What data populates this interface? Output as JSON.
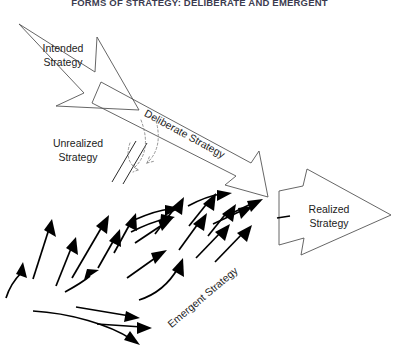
{
  "figure": {
    "title": "FORMS OF STRATEGY: DELIBERATE AND EMERGENT",
    "title_visible": "partially cropped at top edge",
    "background_color": "#ffffff",
    "outline_color": "#555555",
    "arrow_color": "#000000",
    "dashed_color": "#8a8a8a",
    "label_color": "#1c1c1c",
    "title_color": "#3c3c50"
  },
  "labels": {
    "intended": {
      "line1": "Intended",
      "line2": "Strategy"
    },
    "unrealized": {
      "line1": "Unrealized",
      "line2": "Strategy"
    },
    "realized": {
      "line1": "Realized",
      "line2": "Strategy"
    },
    "deliberate": "Deliberate Strategy",
    "emergent": "Emergent Strategy"
  },
  "shapes": {
    "intended_arrow": {
      "name": "intended-strategy-arrow",
      "direction": "down-right",
      "points": "19,24 95,71 97,38 138,109 57,105 84,93"
    },
    "deliberate_arrow": {
      "name": "deliberate-strategy-arrow",
      "direction": "down-right",
      "points": "102,83 250,162 258,152 267,196 226,184 235,175 93,103"
    },
    "realized_arrow": {
      "name": "realized-strategy-arrow",
      "direction": "right",
      "points": "280,190 302,186 306,170 390,214 300,254 303,238 280,245"
    },
    "unrealized_hashes": [
      "112,167 136,141",
      "122,173 146,147"
    ],
    "unrealized_dashed_arrows": [
      "curve-upper",
      "curve-lower"
    ]
  },
  "emergent_arrows_count": 24
}
